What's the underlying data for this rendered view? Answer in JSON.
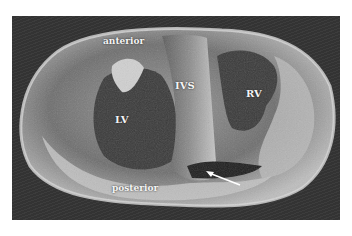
{
  "figure": {
    "colors": {
      "background": "#ffffff",
      "photo_bg": "#363636",
      "tissue_light": "#cfcfcf",
      "tissue_mid": "#8a8a8a",
      "tissue_dark": "#4a4a4a",
      "label": "#f4f4f4"
    },
    "labels": {
      "anterior": "anterior",
      "ivs": "IVS",
      "rv": "RV",
      "lv": "LV",
      "posterior": "posterior"
    },
    "arrow": {
      "color": "#ffffff",
      "from": [
        240,
        185
      ],
      "to": [
        207,
        172
      ]
    }
  }
}
